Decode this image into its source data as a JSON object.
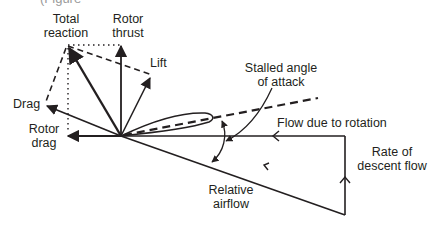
{
  "diagram": {
    "type": "vector-diagram",
    "caption_fragment": "(Figure",
    "labels": {
      "total_reaction": [
        "Total",
        "reaction"
      ],
      "rotor_thrust": [
        "Rotor",
        "thrust"
      ],
      "lift": "Lift",
      "drag": "Drag",
      "rotor_drag": [
        "Rotor",
        "drag"
      ],
      "stalled_angle": [
        "Stalled angle",
        "of attack"
      ],
      "flow_rotation": "Flow due to rotation",
      "descent_flow": [
        "Rate of",
        "descent flow"
      ],
      "relative_airflow": [
        "Relative",
        "airflow"
      ]
    },
    "colors": {
      "ink": "#231f20",
      "background": "#ffffff"
    }
  }
}
